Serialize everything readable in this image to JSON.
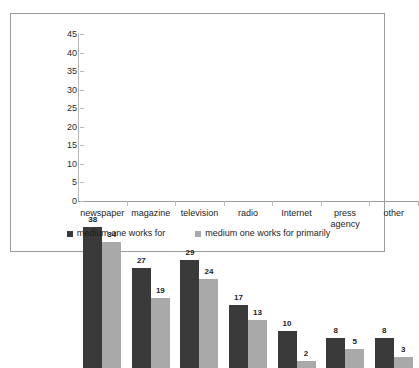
{
  "chart_data": {
    "type": "bar",
    "title": "",
    "xlabel": "",
    "ylabel": "",
    "ylim": [
      0,
      45
    ],
    "ytick_step": 5,
    "yticks": [
      "45",
      "40",
      "35",
      "30",
      "25",
      "20",
      "15",
      "10",
      "5",
      "0"
    ],
    "grid": false,
    "legend_position": "bottom",
    "categories": [
      "newspaper",
      "magazine",
      "television",
      "radio",
      "Internet",
      "press\nagency",
      "other"
    ],
    "series": [
      {
        "name": "medium one works for",
        "color": "#3a3a3a",
        "values": [
          38,
          27,
          29,
          17,
          10,
          8,
          8
        ]
      },
      {
        "name": "medium one works for primarily",
        "color": "#a9a9a9",
        "values": [
          34,
          19,
          24,
          13,
          2,
          5,
          3
        ]
      }
    ]
  },
  "legend": {
    "items": [
      {
        "label": "medium one works for"
      },
      {
        "label": "medium one works for primarily"
      }
    ]
  },
  "caption_sliver": {
    "text": ""
  },
  "colors": {
    "series_dark": "#3a3a3a",
    "series_light": "#a9a9a9",
    "frame_border": "#9a9a9a",
    "axis": "#b9b9b9",
    "text": "#1d1d1d",
    "background": "#ffffff"
  }
}
